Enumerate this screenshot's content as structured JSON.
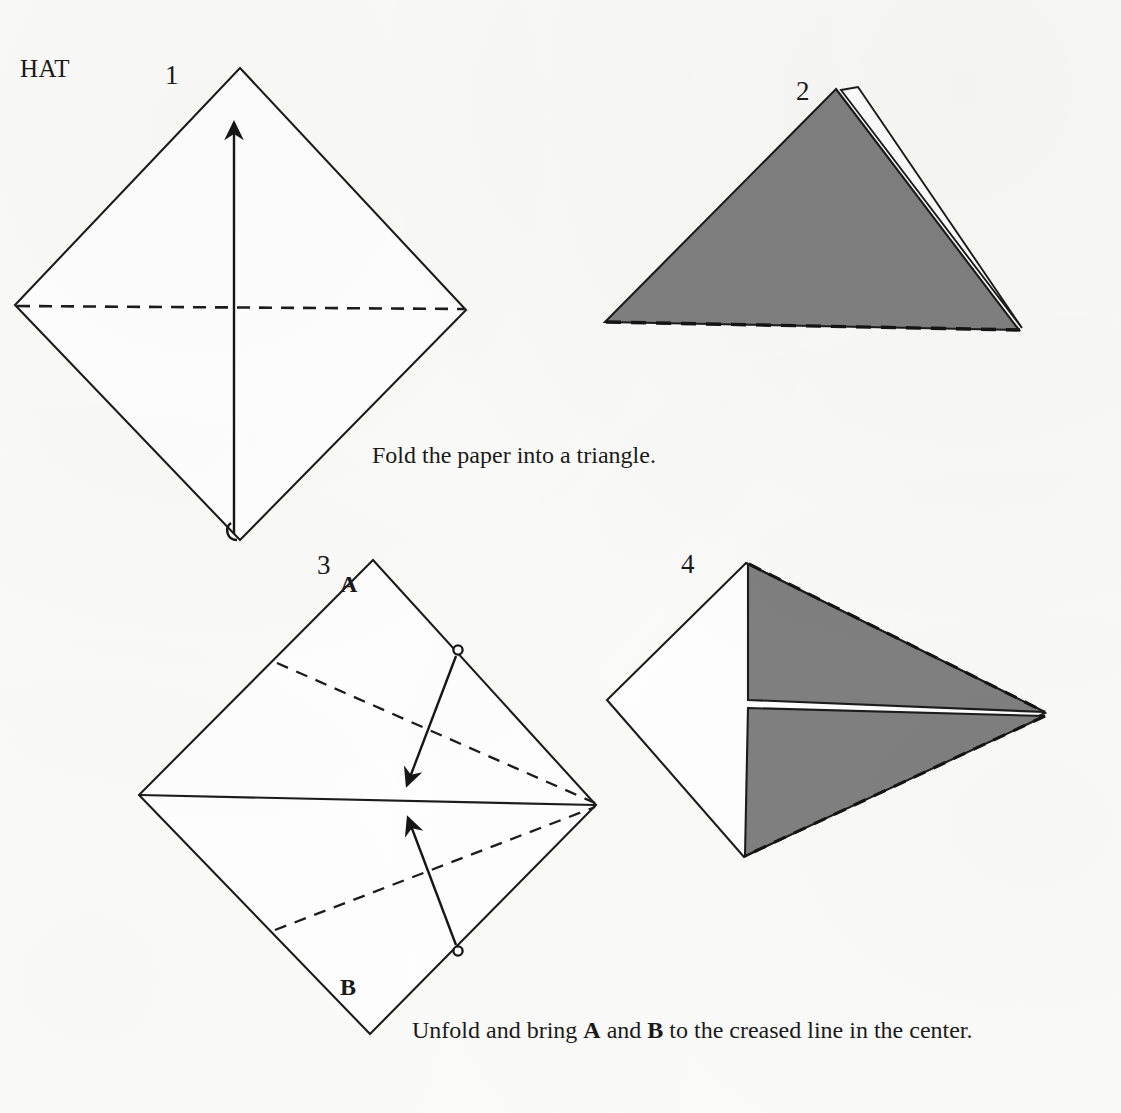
{
  "document": {
    "title": "HAT",
    "type": "origami-instruction-diagram",
    "page_background": "#fbfbf9",
    "ink_color": "#1a1a1a",
    "paper_shaded_color": "#808080"
  },
  "steps": [
    {
      "number": "1",
      "shape": "square sheet shown as a diamond, white side up",
      "fold_line_style": "dashed horizontal valley crease across the middle",
      "arrow": "bottom vertex folds up to the top vertex",
      "caption": "Fold the paper into a triangle."
    },
    {
      "number": "2",
      "shape": "resulting triangle, shaded gray with white back layer visible at the right edge",
      "fold_line_style": "dashed line along the bottom edge",
      "arrow": "",
      "caption": ""
    },
    {
      "number": "3",
      "shape": "unfolded diamond with a solid horizontal creased center line",
      "fold_line_style": "two dashed fold lines meeting the right vertex",
      "arrow": "corners A and B swing in to the creased center line",
      "caption": "Unfold and bring A and B to the creased line in the center.",
      "corner_labels": [
        "A",
        "B"
      ]
    },
    {
      "number": "4",
      "shape": "kite form: white left section with two gray flaps folded toward the right point",
      "fold_line_style": "dashed outer edges on the gray flaps",
      "arrow": "",
      "caption": ""
    }
  ],
  "captions": {
    "step1": "Fold the paper into a triangle.",
    "step3_prefix": "Unfold and bring ",
    "step3_a": "A",
    "step3_mid": " and ",
    "step3_b": "B",
    "step3_suffix": " to the creased line in the center."
  },
  "labels": {
    "step1": "1",
    "step2": "2",
    "step3": "3",
    "step4": "4",
    "corner_a": "A",
    "corner_b": "B"
  }
}
